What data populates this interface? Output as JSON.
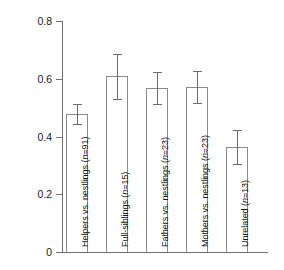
{
  "chart_data": {
    "type": "bar",
    "title": "",
    "xlabel": "",
    "ylabel": "Genetic similarity",
    "ylim": [
      0,
      0.8
    ],
    "yticks": [
      "0",
      "0.2",
      "0.4",
      "0.6",
      "0.8"
    ],
    "ytick_values": [
      0,
      0.2,
      0.4,
      0.6,
      0.8
    ],
    "grid": false,
    "legend": "none",
    "error_bars": "±SE",
    "categories": [
      "Helpers vs. nestlings (n=91)",
      "Full-siblings (n=15)",
      "Fathers vs. nestlings (n=23)",
      "Mothers vs. nestlings (n=23)",
      "Unrelated (n=13)"
    ],
    "values": [
      0.478,
      0.608,
      0.567,
      0.571,
      0.364
    ],
    "errors": [
      0.035,
      0.079,
      0.055,
      0.055,
      0.059
    ],
    "bars": [
      {
        "label_prefix": "Helpers vs. nestlings (",
        "label_n": "n",
        "label_suffix": "=91)",
        "value": 0.478,
        "error": 0.035,
        "n": 91
      },
      {
        "label_prefix": "Full-siblings (",
        "label_n": "n",
        "label_suffix": "=15)",
        "value": 0.608,
        "error": 0.079,
        "n": 15
      },
      {
        "label_prefix": "Fathers vs. nestlings (",
        "label_n": "n",
        "label_suffix": "=23)",
        "value": 0.567,
        "error": 0.055,
        "n": 23
      },
      {
        "label_prefix": "Mothers vs. nestlings (",
        "label_n": "n",
        "label_suffix": "=23)",
        "value": 0.571,
        "error": 0.055,
        "n": 23
      },
      {
        "label_prefix": "Unrelated (",
        "label_n": "n",
        "label_suffix": "=13)",
        "value": 0.364,
        "error": 0.059,
        "n": 13
      }
    ],
    "colors": {
      "bar_fill": "#ffffff",
      "bar_edge": "#8a8a8a",
      "axis": "#6f6f6f",
      "error_bar": "#6b6b6b",
      "text": "#1a1a1a",
      "background": "#ffffff"
    }
  }
}
